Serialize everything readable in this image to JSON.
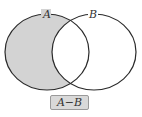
{
  "diagram": {
    "type": "venn",
    "sets": [
      {
        "name": "A",
        "label": "A",
        "shaded_region": "A only"
      },
      {
        "name": "B",
        "label": "B"
      }
    ],
    "caption": "A−B",
    "colors": {
      "shade": "#d3d3d3",
      "stroke": "#2a2a2a",
      "label_box_bg": "#d9d9d9",
      "label_box_border": "#9a9a9a"
    }
  }
}
